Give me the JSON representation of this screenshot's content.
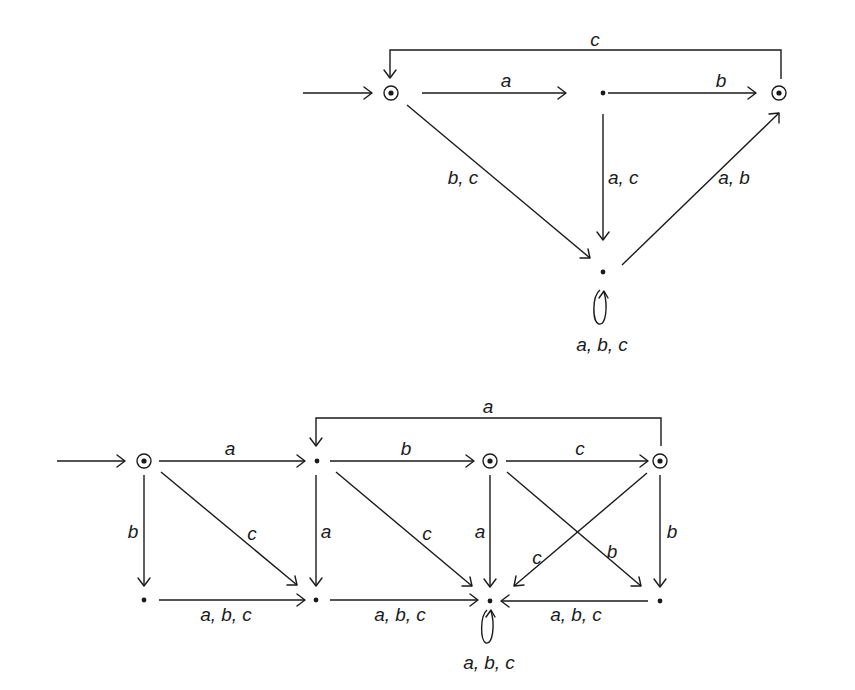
{
  "diagrams": [
    {
      "id": "automaton-top",
      "states": [
        {
          "id": "q0",
          "x": 391,
          "y": 93,
          "initial": true,
          "accepting": true
        },
        {
          "id": "q1",
          "x": 603,
          "y": 93,
          "initial": false,
          "accepting": false
        },
        {
          "id": "q2",
          "x": 779,
          "y": 93,
          "initial": false,
          "accepting": true
        },
        {
          "id": "q3",
          "x": 603,
          "y": 272,
          "initial": false,
          "accepting": false
        }
      ],
      "transitions": [
        {
          "from": "q0",
          "to": "q1",
          "label": "a"
        },
        {
          "from": "q1",
          "to": "q2",
          "label": "b"
        },
        {
          "from": "q2",
          "to": "q0",
          "label": "c"
        },
        {
          "from": "q0",
          "to": "q3",
          "label": "b, c"
        },
        {
          "from": "q1",
          "to": "q3",
          "label": "a, c"
        },
        {
          "from": "q3",
          "to": "q2",
          "label": "a, b"
        },
        {
          "from": "q3",
          "to": "q3",
          "label": "a, b, c"
        }
      ]
    },
    {
      "id": "automaton-bottom",
      "states": [
        {
          "id": "p0",
          "x": 144,
          "y": 461,
          "initial": true,
          "accepting": true
        },
        {
          "id": "p1",
          "x": 315,
          "y": 461,
          "initial": false,
          "accepting": false
        },
        {
          "id": "p2",
          "x": 490,
          "y": 461,
          "initial": false,
          "accepting": true
        },
        {
          "id": "p3",
          "x": 660,
          "y": 461,
          "initial": false,
          "accepting": true
        },
        {
          "id": "p4",
          "x": 144,
          "y": 600,
          "initial": false,
          "accepting": false
        },
        {
          "id": "p5",
          "x": 315,
          "y": 600,
          "initial": false,
          "accepting": false
        },
        {
          "id": "p6",
          "x": 490,
          "y": 600,
          "initial": false,
          "accepting": false
        },
        {
          "id": "p7",
          "x": 660,
          "y": 600,
          "initial": false,
          "accepting": false
        }
      ],
      "transitions": [
        {
          "from": "p0",
          "to": "p1",
          "label": "a"
        },
        {
          "from": "p1",
          "to": "p2",
          "label": "b"
        },
        {
          "from": "p2",
          "to": "p3",
          "label": "c"
        },
        {
          "from": "p3",
          "to": "p1",
          "label": "a"
        },
        {
          "from": "p0",
          "to": "p4",
          "label": "b"
        },
        {
          "from": "p0",
          "to": "p5",
          "label": "c"
        },
        {
          "from": "p1",
          "to": "p5",
          "label": "a"
        },
        {
          "from": "p1",
          "to": "p6",
          "label": "c"
        },
        {
          "from": "p2",
          "to": "p6",
          "label": "a"
        },
        {
          "from": "p2",
          "to": "p7",
          "label": "b"
        },
        {
          "from": "p3",
          "to": "p6",
          "label": "c"
        },
        {
          "from": "p3",
          "to": "p7",
          "label": "b"
        },
        {
          "from": "p4",
          "to": "p5",
          "label": "a, b, c"
        },
        {
          "from": "p5",
          "to": "p6",
          "label": "a, b, c"
        },
        {
          "from": "p7",
          "to": "p6",
          "label": "a, b, c"
        },
        {
          "from": "p6",
          "to": "p6",
          "label": "a, b, c"
        }
      ]
    }
  ],
  "labels": {
    "top": {
      "q0_q1": "a",
      "q1_q2": "b",
      "q2_q0": "c",
      "q0_q3": "b, c",
      "q1_q3": "a, c",
      "q3_q2": "a, b",
      "q3_loop": "a, b, c"
    },
    "bottom": {
      "p0_p1": "a",
      "p1_p2": "b",
      "p2_p3": "c",
      "p3_p1": "a",
      "p0_p4": "b",
      "p0_p5": "c",
      "p1_p5": "a",
      "p1_p6": "c",
      "p2_p6": "a",
      "p2_p7": "b",
      "p3_p6": "c",
      "p3_p7": "b",
      "p4_p5": "a, b, c",
      "p5_p6": "a, b, c",
      "p7_p6": "a, b, c",
      "p6_loop": "a, b, c"
    }
  }
}
